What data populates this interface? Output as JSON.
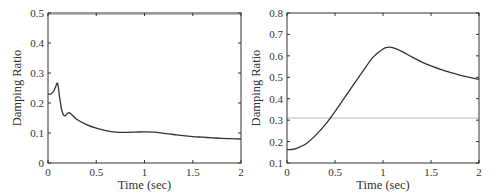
{
  "chart_data": [
    {
      "type": "line",
      "title": "",
      "xlabel": "Time (sec)",
      "ylabel": "Damping Ratio",
      "xlim": [
        0,
        2
      ],
      "ylim": [
        0,
        0.5
      ],
      "xticks": [
        "0",
        "0.5",
        "1",
        "1.5",
        "2"
      ],
      "yticks": [
        "0",
        "0.1",
        "0.2",
        "0.3",
        "0.4",
        "0.5"
      ],
      "grid": false,
      "reference_line": {
        "y": 0.495,
        "color": "#bbbbbb"
      },
      "series": [
        {
          "name": "damping ratio",
          "color": "#333333",
          "x": [
            0,
            0.03,
            0.06,
            0.08,
            0.1,
            0.12,
            0.14,
            0.16,
            0.18,
            0.2,
            0.22,
            0.25,
            0.3,
            0.4,
            0.5,
            0.6,
            0.7,
            0.8,
            0.9,
            1.0,
            1.1,
            1.2,
            1.3,
            1.4,
            1.5,
            1.6,
            1.7,
            1.8,
            1.9,
            2.0
          ],
          "y": [
            0.23,
            0.23,
            0.24,
            0.255,
            0.265,
            0.22,
            0.18,
            0.16,
            0.158,
            0.165,
            0.168,
            0.16,
            0.145,
            0.128,
            0.116,
            0.108,
            0.103,
            0.102,
            0.103,
            0.104,
            0.103,
            0.099,
            0.095,
            0.091,
            0.088,
            0.086,
            0.084,
            0.082,
            0.081,
            0.08
          ]
        }
      ]
    },
    {
      "type": "line",
      "title": "",
      "xlabel": "Time (sec)",
      "ylabel": "Damping Ratio",
      "xlim": [
        0,
        2
      ],
      "ylim": [
        0.1,
        0.8
      ],
      "xticks": [
        "0",
        "0.5",
        "1",
        "1.5",
        "2"
      ],
      "yticks": [
        "0.1",
        "0.2",
        "0.3",
        "0.4",
        "0.5",
        "0.6",
        "0.7",
        "0.8"
      ],
      "grid": false,
      "reference_line": {
        "y": 0.31,
        "color": "#bbbbbb"
      },
      "series": [
        {
          "name": "damping ratio",
          "color": "#333333",
          "x": [
            0,
            0.05,
            0.1,
            0.2,
            0.3,
            0.4,
            0.5,
            0.6,
            0.7,
            0.8,
            0.9,
            1.0,
            1.05,
            1.1,
            1.2,
            1.3,
            1.4,
            1.5,
            1.6,
            1.7,
            1.8,
            1.9,
            2.0
          ],
          "y": [
            0.163,
            0.163,
            0.168,
            0.19,
            0.23,
            0.28,
            0.34,
            0.405,
            0.47,
            0.535,
            0.595,
            0.632,
            0.64,
            0.638,
            0.62,
            0.595,
            0.572,
            0.553,
            0.537,
            0.523,
            0.51,
            0.5,
            0.49
          ]
        }
      ]
    }
  ]
}
